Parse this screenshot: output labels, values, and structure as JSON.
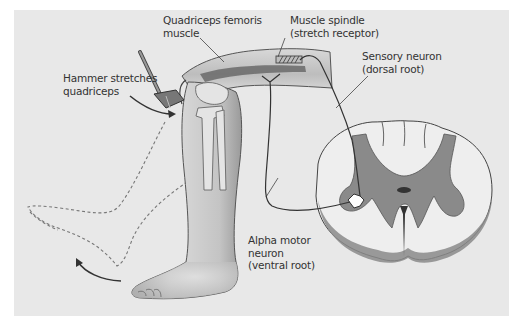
{
  "figure": {
    "background_color": "#e8e8e8",
    "labels": {
      "quadriceps": {
        "line1": "Quadriceps femoris",
        "line2": "muscle"
      },
      "spindle": {
        "line1": "Muscle spindle",
        "line2": "(stretch receptor)"
      },
      "hammer": {
        "line1": "Hammer stretches",
        "line2": "quadriceps"
      },
      "sensory": {
        "line1": "Sensory neuron",
        "line2": "(dorsal root)"
      },
      "motor": {
        "line1": "Alpha motor",
        "line2": "neuron",
        "line3": "(ventral root)"
      }
    },
    "colors": {
      "gray_matter": "#8a8a8a",
      "white_matter": "#eeeeee",
      "outline": "#444444",
      "leg_fill": "#c8c8c8",
      "nerve": "#333333"
    }
  }
}
